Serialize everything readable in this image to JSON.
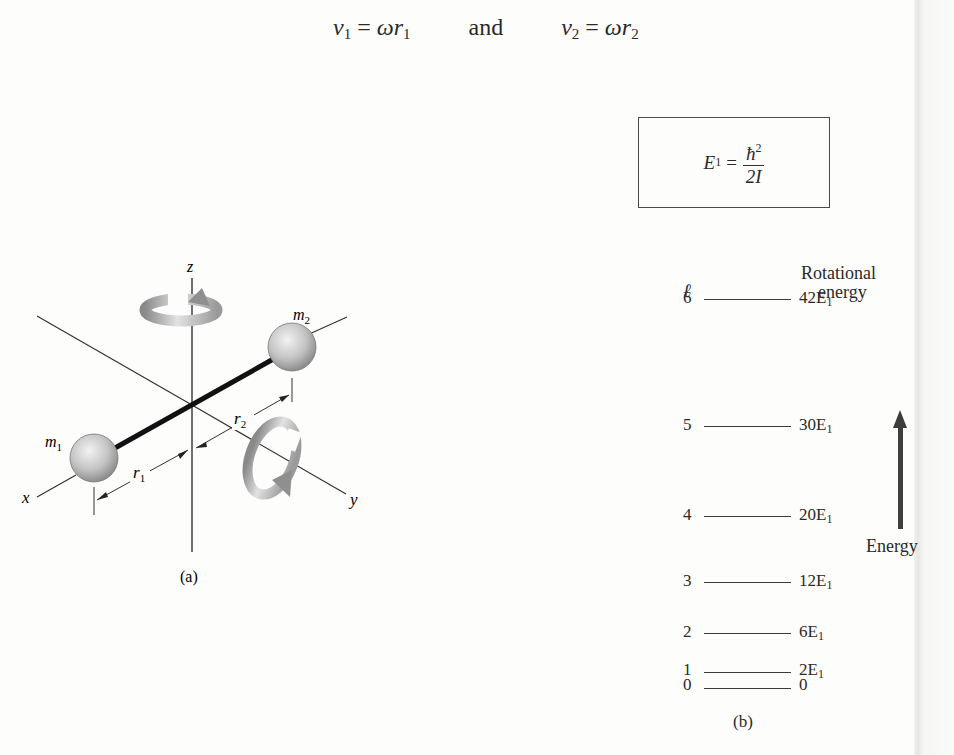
{
  "equation_top": {
    "v1": "v",
    "v1_sub": "1",
    "eq1": "=",
    "omega1": "ω",
    "r1": "r",
    "r1_sub": "1",
    "conj": "and",
    "v2": "v",
    "v2_sub": "2",
    "eq2": "=",
    "omega2": "ω",
    "r2": "r",
    "r2_sub": "2"
  },
  "figure_a": {
    "caption": "(a)",
    "axes": {
      "x": "x",
      "y": "y",
      "z": "z"
    },
    "masses": [
      {
        "label": "m",
        "sub": "1"
      },
      {
        "label": "m",
        "sub": "2"
      }
    ],
    "distances": [
      {
        "label": "r",
        "sub": "1"
      },
      {
        "label": "r",
        "sub": "2"
      }
    ],
    "rotation_arrows": [
      "rotation-about-z",
      "rotation-about-y"
    ]
  },
  "figure_b": {
    "caption": "(b)",
    "formula_box": {
      "lhs": "E",
      "lhs_sub": "1",
      "eq": "=",
      "numerator": "ħ",
      "numerator_sup": "2",
      "denominator": "2I"
    },
    "column_header_l": "ℓ",
    "column_header_energy_line1": "Rotational",
    "column_header_energy_line2": "energy",
    "axis_label": "Energy",
    "levels": [
      {
        "l": "6",
        "energy": "42E",
        "sub": "1",
        "value_in_E1": 42
      },
      {
        "l": "5",
        "energy": "30E",
        "sub": "1",
        "value_in_E1": 30
      },
      {
        "l": "4",
        "energy": "20E",
        "sub": "1",
        "value_in_E1": 20
      },
      {
        "l": "3",
        "energy": "12E",
        "sub": "1",
        "value_in_E1": 12
      },
      {
        "l": "2",
        "energy": "6E",
        "sub": "1",
        "value_in_E1": 6
      },
      {
        "l": "1",
        "energy": "2E",
        "sub": "1",
        "value_in_E1": 2
      },
      {
        "l": "0",
        "energy": "0",
        "sub": "",
        "value_in_E1": 0
      }
    ]
  }
}
